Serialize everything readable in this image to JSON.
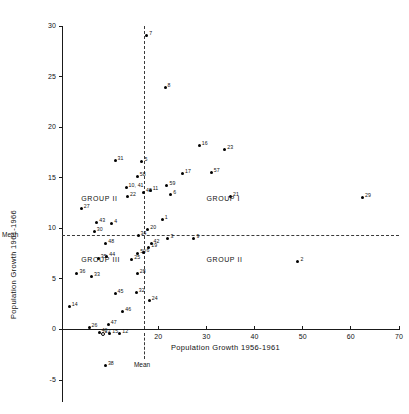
{
  "chart_data": {
    "type": "scatter",
    "title": "",
    "xlabel": "Population Growth 1956-1961",
    "ylabel": "Population Growth 1961-1966",
    "xlim": [
      -5,
      70
    ],
    "ylim": [
      -5,
      30
    ],
    "xticks": [
      "20",
      "30",
      "40",
      "50",
      "60",
      "70"
    ],
    "xtick_values": [
      20,
      30,
      40,
      50,
      60,
      70
    ],
    "yticks": [
      "30",
      "25",
      "20",
      "15",
      "10",
      "5",
      "0",
      "-5"
    ],
    "ytick_values": [
      30,
      25,
      20,
      15,
      10,
      5,
      0,
      -5
    ],
    "grid": false,
    "legend_position": "none",
    "mean_x": 17.0,
    "mean_y": 9.3,
    "mean_x_label": "Mean",
    "mean_y_label": "Mean",
    "group_labels": [
      {
        "text": "GROUP II",
        "x": 4.0,
        "y": 12.9
      },
      {
        "text": "GROUP I",
        "x": 30.0,
        "y": 12.9
      },
      {
        "text": "GROUP III",
        "x": 4.0,
        "y": 6.9
      },
      {
        "text": "GROUP II",
        "x": 30.0,
        "y": 6.9
      }
    ],
    "points": [
      {
        "id": "7",
        "x": 17.6,
        "y": 29.1
      },
      {
        "id": "8",
        "x": 21.4,
        "y": 23.9
      },
      {
        "id": "16",
        "x": 28.5,
        "y": 18.2
      },
      {
        "id": "23",
        "x": 33.8,
        "y": 17.8
      },
      {
        "id": "31",
        "x": 11.0,
        "y": 16.7
      },
      {
        "id": "5",
        "x": 16.6,
        "y": 16.6
      },
      {
        "id": "57",
        "x": 31.0,
        "y": 15.5
      },
      {
        "id": "17",
        "x": 25.0,
        "y": 15.4
      },
      {
        "id": "58",
        "x": 15.6,
        "y": 15.1
      },
      {
        "id": "59",
        "x": 21.8,
        "y": 14.2
      },
      {
        "id": "10, 41",
        "x": 13.3,
        "y": 14.0
      },
      {
        "id": "11",
        "x": 18.3,
        "y": 13.7
      },
      {
        "id": "49",
        "x": 16.9,
        "y": 13.5
      },
      {
        "id": "6",
        "x": 22.6,
        "y": 13.3
      },
      {
        "id": "22",
        "x": 13.6,
        "y": 13.1
      },
      {
        "id": "21",
        "x": 35.0,
        "y": 13.1
      },
      {
        "id": "29",
        "x": 62.4,
        "y": 13.0
      },
      {
        "id": "27",
        "x": 4.0,
        "y": 12.0
      },
      {
        "id": "43",
        "x": 7.2,
        "y": 10.6
      },
      {
        "id": "4",
        "x": 10.3,
        "y": 10.5
      },
      {
        "id": "1",
        "x": 20.8,
        "y": 10.9
      },
      {
        "id": "30",
        "x": 6.7,
        "y": 9.7
      },
      {
        "id": "20",
        "x": 17.8,
        "y": 9.9
      },
      {
        "id": "34",
        "x": 15.8,
        "y": 9.3
      },
      {
        "id": "3",
        "x": 22.0,
        "y": 9.0
      },
      {
        "id": "9",
        "x": 27.4,
        "y": 9.0
      },
      {
        "id": "48",
        "x": 9.1,
        "y": 8.5
      },
      {
        "id": "42",
        "x": 18.5,
        "y": 8.5
      },
      {
        "id": "19",
        "x": 18.0,
        "y": 8.1
      },
      {
        "id": "50",
        "x": 15.7,
        "y": 7.5
      },
      {
        "id": "6b",
        "x": 17.0,
        "y": 7.6
      },
      {
        "id": "44",
        "x": 9.3,
        "y": 7.2
      },
      {
        "id": "35",
        "x": 7.5,
        "y": 7.0
      },
      {
        "id": "25",
        "x": 14.5,
        "y": 6.9
      },
      {
        "id": "36",
        "x": 3.1,
        "y": 5.5
      },
      {
        "id": "33",
        "x": 6.1,
        "y": 5.2
      },
      {
        "id": "28",
        "x": 15.6,
        "y": 5.5
      },
      {
        "id": "45",
        "x": 11.0,
        "y": 3.6
      },
      {
        "id": "32",
        "x": 15.4,
        "y": 3.7
      },
      {
        "id": "24",
        "x": 18.1,
        "y": 2.9
      },
      {
        "id": "14",
        "x": 1.5,
        "y": 2.3
      },
      {
        "id": "46",
        "x": 12.6,
        "y": 1.8
      },
      {
        "id": "26",
        "x": 5.6,
        "y": 0.2
      },
      {
        "id": "47",
        "x": 9.6,
        "y": 0.5
      },
      {
        "id": "40",
        "x": 7.7,
        "y": -0.3
      },
      {
        "id": "13",
        "x": 8.3,
        "y": -0.4
      },
      {
        "id": "15",
        "x": 9.9,
        "y": -0.4
      },
      {
        "id": "12",
        "x": 12.0,
        "y": -0.4
      },
      {
        "id": "2",
        "x": 49.0,
        "y": 6.7
      },
      {
        "id": "38",
        "x": 9.0,
        "y": -3.6
      }
    ]
  }
}
